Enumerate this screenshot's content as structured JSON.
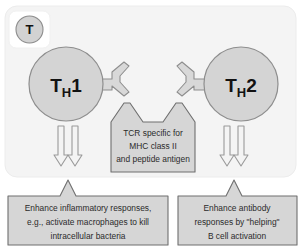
{
  "figure": {
    "panel": {
      "background_color": "#f4f4f4",
      "border_color": "#ececec"
    },
    "badge": {
      "letter": "T",
      "name": "t-cell-badge",
      "circle_fill": "#d2d2d2",
      "circle_stroke": "#8c8c8c",
      "plate_fill": "#ffffff"
    },
    "cells": [
      {
        "id": "th1",
        "label_main": "T",
        "label_sub": "H",
        "label_num": "1",
        "fill": "#d4d4d4",
        "stroke": "#8e8e8e"
      },
      {
        "id": "th2",
        "label_main": "T",
        "label_sub": "H",
        "label_num": "2",
        "fill": "#d4d4d4",
        "stroke": "#8e8e8e"
      }
    ],
    "receptors": {
      "name": "tcr-receptor",
      "fill": "#d8d8d8",
      "stroke": "#8e8e8e",
      "count": 2
    },
    "tcr_box": {
      "fill": "#d6d6d6",
      "stroke": "#6f6f6f",
      "lines": [
        "TCR specific for",
        "MHC class II",
        "and peptide antigen"
      ]
    },
    "arrows": {
      "fill": "#f2f2f2",
      "stroke": "#9a9a9a",
      "groups": 2,
      "per_group": 2
    },
    "outcome_boxes": [
      {
        "id": "th1-outcome",
        "fill": "#d6d6d6",
        "stroke": "#6f6f6f",
        "lines": [
          "Enhance inflammatory responses,",
          "e.g., activate macrophages to kill",
          "intracellular bacteria"
        ]
      },
      {
        "id": "th2-outcome",
        "fill": "#d6d6d6",
        "stroke": "#6f6f6f",
        "lines": [
          "Enhance antibody",
          "responses by \"helping\"",
          "B cell activation"
        ]
      }
    ]
  }
}
